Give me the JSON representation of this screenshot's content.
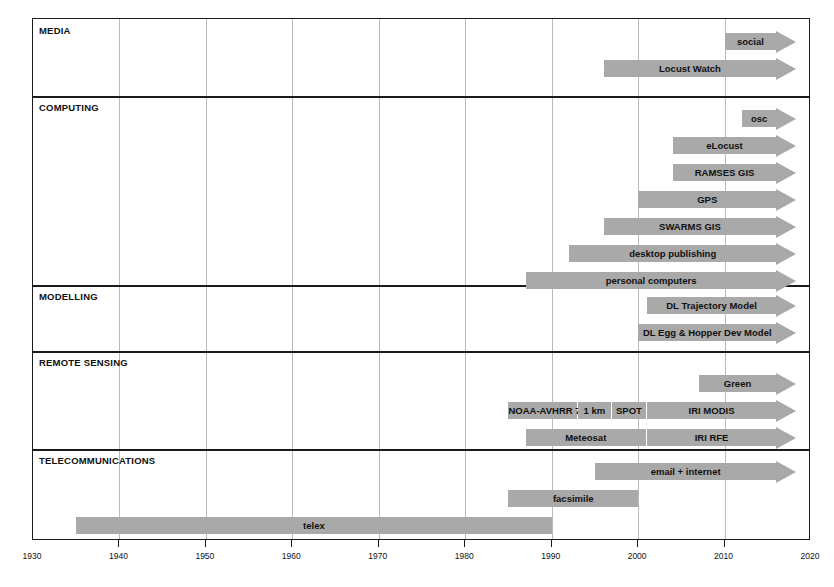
{
  "chart_data": {
    "type": "bar",
    "title": "",
    "subtitle": "",
    "xlabel": "",
    "ylabel": "",
    "orientation": "horizontal",
    "grid": true,
    "legend": "none",
    "xlim": [
      1930,
      2020
    ],
    "x_ticks": [
      1930,
      1940,
      1950,
      1960,
      1970,
      1980,
      1990,
      2000,
      2010,
      2020
    ],
    "x_tick_labels": [
      "1930",
      "1940",
      "1950",
      "1960",
      "1970",
      "1980",
      "1990",
      "2000",
      "2010",
      "2020"
    ],
    "bar_color": "#a9a9a9",
    "sections": [
      {
        "name": "MEDIA",
        "bars": [
          {
            "label": "social",
            "start": 2010,
            "end": 2016,
            "open_ended": true
          },
          {
            "label": "Locust Watch",
            "start": 1996,
            "end": 2016,
            "open_ended": true
          }
        ]
      },
      {
        "name": "COMPUTING",
        "bars": [
          {
            "label": "osc",
            "start": 2012,
            "end": 2016,
            "open_ended": true
          },
          {
            "label": "eLocust",
            "start": 2004,
            "end": 2016,
            "open_ended": true
          },
          {
            "label": "RAMSES GIS",
            "start": 2004,
            "end": 2016,
            "open_ended": true
          },
          {
            "label": "GPS",
            "start": 2000,
            "end": 2016,
            "open_ended": true
          },
          {
            "label": "SWARMS GIS",
            "start": 1996,
            "end": 2016,
            "open_ended": true
          },
          {
            "label": "desktop publishing",
            "start": 1992,
            "end": 2016,
            "open_ended": true
          },
          {
            "label": "personal computers",
            "start": 1987,
            "end": 2016,
            "open_ended": true
          }
        ]
      },
      {
        "name": "MODELLING",
        "bars": [
          {
            "label": "DL Trajectory Model",
            "start": 2001,
            "end": 2016,
            "open_ended": true
          },
          {
            "label": "DL Egg & Hopper Dev Model",
            "start": 2000,
            "end": 2016,
            "open_ended": true
          }
        ]
      },
      {
        "name": "REMOTE SENSING",
        "bars": [
          {
            "label": "Green",
            "start": 2007,
            "end": 2016,
            "open_ended": true
          }
        ],
        "segmented_bars": [
          {
            "name": "satellite-imagery-track",
            "open_ended": true,
            "segments": [
              {
                "label": "NOAA-AVHRR 7km",
                "start": 1985,
                "end": 1993
              },
              {
                "label": "1 km",
                "start": 1993,
                "end": 1997
              },
              {
                "label": "SPOT",
                "start": 1997,
                "end": 2001
              },
              {
                "label": "IRI MODIS",
                "start": 2001,
                "end": 2016
              }
            ]
          },
          {
            "name": "rainfall-estimate-track",
            "open_ended": true,
            "segments": [
              {
                "label": "Meteosat",
                "start": 1987,
                "end": 2001
              },
              {
                "label": "IRI RFE",
                "start": 2001,
                "end": 2016
              }
            ]
          }
        ]
      },
      {
        "name": "TELECOMMUNICATIONS",
        "bars": [
          {
            "label": "email + internet",
            "start": 1995,
            "end": 2016,
            "open_ended": true
          },
          {
            "label": "facsimile",
            "start": 1985,
            "end": 2000,
            "open_ended": false
          },
          {
            "label": "telex",
            "start": 1935,
            "end": 1990,
            "open_ended": false
          }
        ]
      }
    ]
  },
  "caption": {
    "text": ""
  }
}
